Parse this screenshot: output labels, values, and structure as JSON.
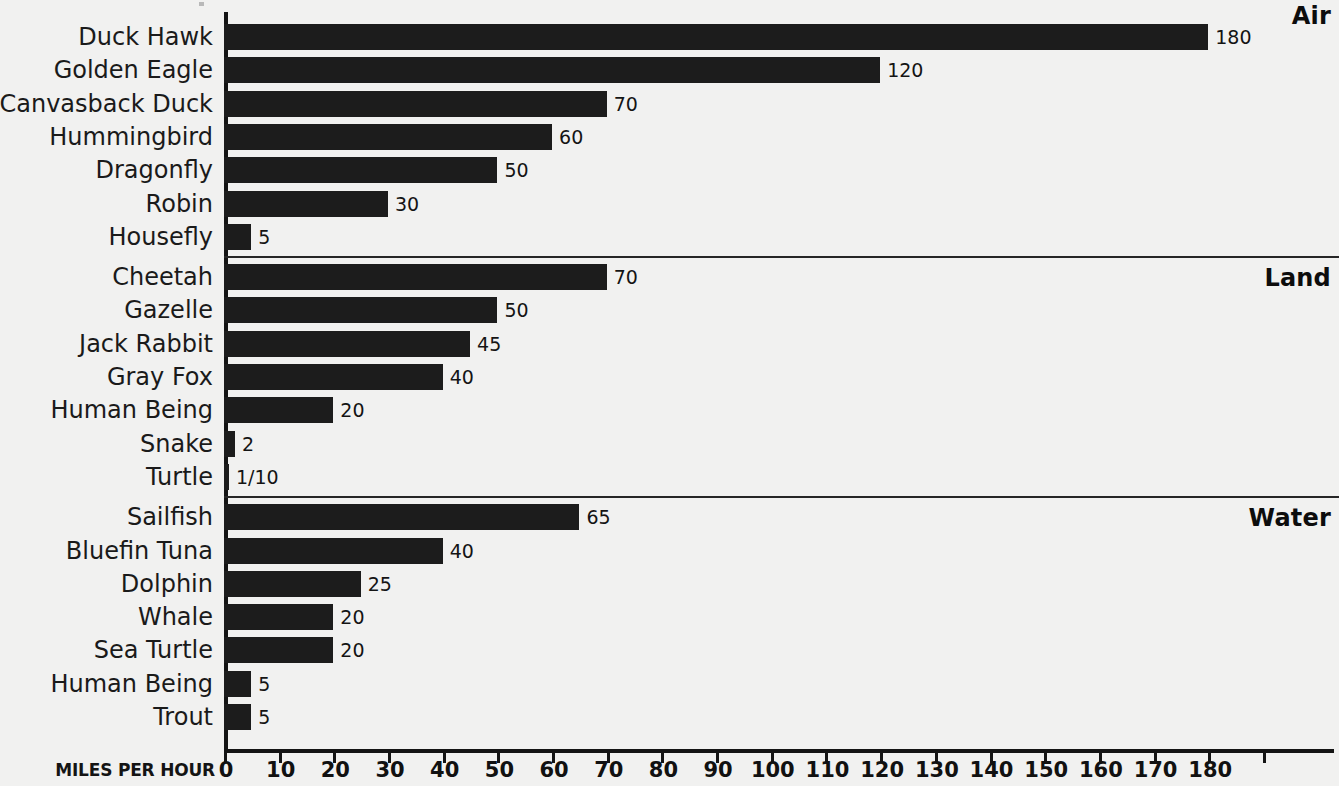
{
  "chart_data": {
    "type": "bar",
    "orientation": "horizontal",
    "title": "",
    "xlabel": "MILES PER HOUR",
    "ylabel": "",
    "xlim": [
      0,
      190
    ],
    "grid": false,
    "legend": "none",
    "tick_step": 10,
    "tick_labels": [
      "0",
      "10",
      "20",
      "30",
      "40",
      "50",
      "60",
      "70",
      "80",
      "90",
      "100",
      "110",
      "120",
      "130",
      "140",
      "150",
      "160",
      "170",
      "180"
    ],
    "groups": [
      {
        "name": "Air",
        "categories": [
          "Duck Hawk",
          "Golden Eagle",
          "Canvasback Duck",
          "Hummingbird",
          "Dragonfly",
          "Robin",
          "Housefly"
        ],
        "values": [
          180,
          120,
          70,
          60,
          50,
          30,
          5
        ],
        "labels": [
          "180",
          "120",
          "70",
          "60",
          "50",
          "30",
          "5"
        ]
      },
      {
        "name": "Land",
        "categories": [
          "Cheetah",
          "Gazelle",
          "Jack Rabbit",
          "Gray Fox",
          "Human Being",
          "Snake",
          "Turtle"
        ],
        "values": [
          70,
          50,
          45,
          40,
          20,
          2,
          0.1
        ],
        "labels": [
          "70",
          "50",
          "45",
          "40",
          "20",
          "2",
          "1/10"
        ]
      },
      {
        "name": "Water",
        "categories": [
          "Sailfish",
          "Bluefin Tuna",
          "Dolphin",
          "Whale",
          "Sea  Turtle",
          "Human Being",
          "Trout"
        ],
        "values": [
          65,
          40,
          25,
          20,
          20,
          5,
          5
        ],
        "labels": [
          "65",
          "40",
          "25",
          "20",
          "20",
          "5",
          "5"
        ]
      }
    ],
    "colors": {
      "bar": "#1c1c1c",
      "background": "#f1f1f0",
      "axis": "#141414",
      "text": "#141414"
    }
  }
}
